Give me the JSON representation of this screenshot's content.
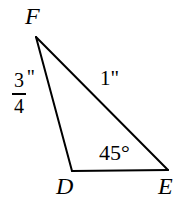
{
  "figure": {
    "type": "triangle-diagram",
    "background_color": "#ffffff",
    "stroke_color": "#000000",
    "stroke_width": 2,
    "vertices": [
      {
        "name": "F",
        "label": "F",
        "x": 36,
        "y": 37
      },
      {
        "name": "D",
        "label": "D",
        "x": 72,
        "y": 171
      },
      {
        "name": "E",
        "label": "E",
        "x": 168,
        "y": 170
      }
    ],
    "sides": [
      {
        "name": "FD",
        "from": "F",
        "to": "D",
        "measure_numerator": "3",
        "measure_denominator": "4",
        "measure_unit": "\"",
        "measure_text": "3/4\""
      },
      {
        "name": "FE",
        "from": "F",
        "to": "E",
        "measure_text": "1\""
      },
      {
        "name": "DE",
        "from": "D",
        "to": "E",
        "measure_text": ""
      }
    ],
    "angles": [
      {
        "name": "angle-E",
        "at_vertex": "E",
        "label": "45°"
      }
    ]
  }
}
